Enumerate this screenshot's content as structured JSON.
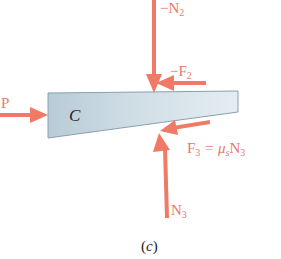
{
  "figure": {
    "caption": "(c)",
    "caption_letter": "c",
    "body_label": "C",
    "colors": {
      "force_arrow": "#f07a65",
      "force_label": "#e8786a",
      "wedge_fill_light": "#dde8ee",
      "wedge_fill_dark": "#b9ccd8",
      "wedge_edge": "#8aa0ae"
    },
    "forces": [
      {
        "name": "neg-N2",
        "label": "−N",
        "subscript": "2",
        "direction": "down"
      },
      {
        "name": "neg-F2",
        "label": "−F",
        "subscript": "2",
        "direction": "left"
      },
      {
        "name": "P",
        "label": "P",
        "subscript": "",
        "direction": "right"
      },
      {
        "name": "F3",
        "label": "F",
        "subscript": "3",
        "equation_rhs": " = μ",
        "rhs_sub": "s",
        "rhs_tail": "N",
        "rhs_tail_sub": "3",
        "direction": "left"
      },
      {
        "name": "N3",
        "label": "N",
        "subscript": "3",
        "direction": "up"
      }
    ]
  }
}
